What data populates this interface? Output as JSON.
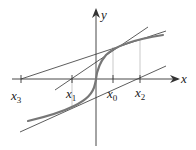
{
  "diagram": {
    "axes": {
      "x_label": "x",
      "y_label": "y"
    },
    "points": [
      {
        "name": "x3",
        "base": "x",
        "sub": "3"
      },
      {
        "name": "x1",
        "base": "x",
        "sub": "1"
      },
      {
        "name": "x0",
        "base": "x",
        "sub": "0"
      },
      {
        "name": "x2",
        "base": "x",
        "sub": "2"
      }
    ],
    "colors": {
      "axis": "#333333",
      "curve": "#777777",
      "tangent": "#333333",
      "guide": "#bbbbbb"
    }
  }
}
